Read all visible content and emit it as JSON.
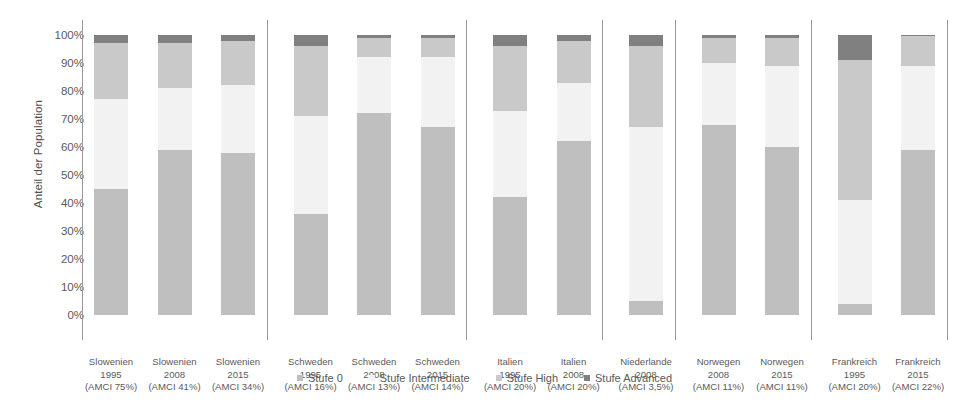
{
  "chart_data": {
    "type": "bar",
    "subtype": "stacked-bar-100-percent",
    "title": "",
    "xlabel": "",
    "ylabel": "Anteil der Population",
    "ylim": [
      0,
      100
    ],
    "ytick_labels": [
      "100%",
      "90%",
      "80%",
      "70%",
      "60%",
      "50%",
      "40%",
      "30%",
      "20%",
      "10%",
      "0%"
    ],
    "ytick_values": [
      100,
      90,
      80,
      70,
      60,
      50,
      40,
      30,
      20,
      10,
      0
    ],
    "grid": false,
    "legend_position": "bottom",
    "legend": [
      "Stufe 0",
      "Stufe Intermediate",
      "Stufe High",
      "Stufe Advanced"
    ],
    "series": [
      {
        "name": "Stufe 0",
        "color": "#bfbfbf",
        "values": [
          45,
          59,
          58,
          36,
          72,
          67,
          42,
          62,
          5,
          68,
          60,
          4,
          59
        ]
      },
      {
        "name": "Stufe Intermediate",
        "color": "#f2f2f2",
        "values": [
          32,
          22,
          24,
          35,
          20,
          25,
          31,
          21,
          62,
          22,
          29,
          37,
          30
        ]
      },
      {
        "name": "Stufe High",
        "color": "#c9c9c9",
        "values": [
          20,
          16,
          16,
          25,
          7,
          7,
          23,
          15,
          29,
          9,
          10,
          50,
          10.5
        ]
      },
      {
        "name": "Stufe Advanced",
        "color": "#808080",
        "values": [
          3,
          3,
          2,
          4,
          1,
          1,
          4,
          2,
          4,
          1,
          1,
          9,
          0.5
        ]
      }
    ],
    "categories": [
      {
        "country": "Slowenien",
        "year": "1995",
        "amci": "(AMCI 75%)"
      },
      {
        "country": "Slowenien",
        "year": "2008",
        "amci": "(AMCI 41%)"
      },
      {
        "country": "Slowenien",
        "year": "2015",
        "amci": "(AMCI 34%)"
      },
      {
        "country": "Schweden",
        "year": "1995",
        "amci": "(AMCI 16%)"
      },
      {
        "country": "Schweden",
        "year": "2008",
        "amci": "(AMCI 13%)"
      },
      {
        "country": "Schweden",
        "year": "2015",
        "amci": "(AMCI 14%)"
      },
      {
        "country": "Italien",
        "year": "1995",
        "amci": "(AMCI 20%)"
      },
      {
        "country": "Italien",
        "year": "2008",
        "amci": "(AMCI 20%)"
      },
      {
        "country": "Niederlande",
        "year": "2008",
        "amci": "(AMCI 3,5%)"
      },
      {
        "country": "Norwegen",
        "year": "2008",
        "amci": "(AMCI 11%)"
      },
      {
        "country": "Norwegen",
        "year": "2015",
        "amci": "(AMCI 11%)"
      },
      {
        "country": "Frankreich",
        "year": "1995",
        "amci": "(AMCI 20%)"
      },
      {
        "country": "Frankreich",
        "year": "2015",
        "amci": "(AMCI 22%)"
      }
    ],
    "group_breaks_after_index": [
      2,
      5,
      7,
      8,
      10
    ],
    "colors": {
      "stufe_0": "#bfbfbf",
      "stufe_intermediate": "#f2f2f2",
      "stufe_high": "#c9c9c9",
      "stufe_advanced": "#808080",
      "axis": "#9a9a9a",
      "text": "#5a5a5a"
    }
  }
}
